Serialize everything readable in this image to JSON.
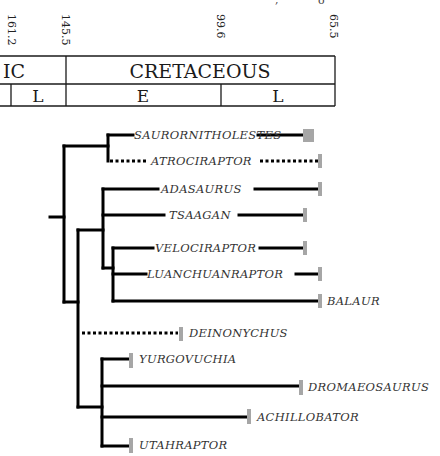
{
  "timescale": {
    "ticks": [
      {
        "label": "161.2",
        "x": 12
      },
      {
        "label": "145.5",
        "x": 66
      },
      {
        "label": "99.6",
        "x": 221
      },
      {
        "label": "65.5",
        "x": 334
      }
    ],
    "periods": [
      {
        "label": "IC",
        "x": 20
      },
      {
        "label": "CRETACEOUS",
        "x": 200
      }
    ],
    "epochs": [
      {
        "label": "L",
        "x": 38
      },
      {
        "label": "E",
        "x": 143
      },
      {
        "label": "L",
        "x": 278
      }
    ]
  },
  "taxa": [
    {
      "name": "SAURORNITHOLESTES"
    },
    {
      "name": "ATROCIRAPTOR"
    },
    {
      "name": "ADASAURUS"
    },
    {
      "name": "TSAAGAN"
    },
    {
      "name": "VELOCIRAPTOR"
    },
    {
      "name": "LUANCHUANRAPTOR"
    },
    {
      "name": "BALAUR"
    },
    {
      "name": "DEINONYCHUS"
    },
    {
      "name": "YURGOVUCHIA"
    },
    {
      "name": "DROMAEOSAURUS"
    },
    {
      "name": "ACHILLOBATOR"
    },
    {
      "name": "UTAHRAPTOR"
    }
  ],
  "colors": {
    "range_bar": "#a6a6a6",
    "branch": "#000000"
  }
}
